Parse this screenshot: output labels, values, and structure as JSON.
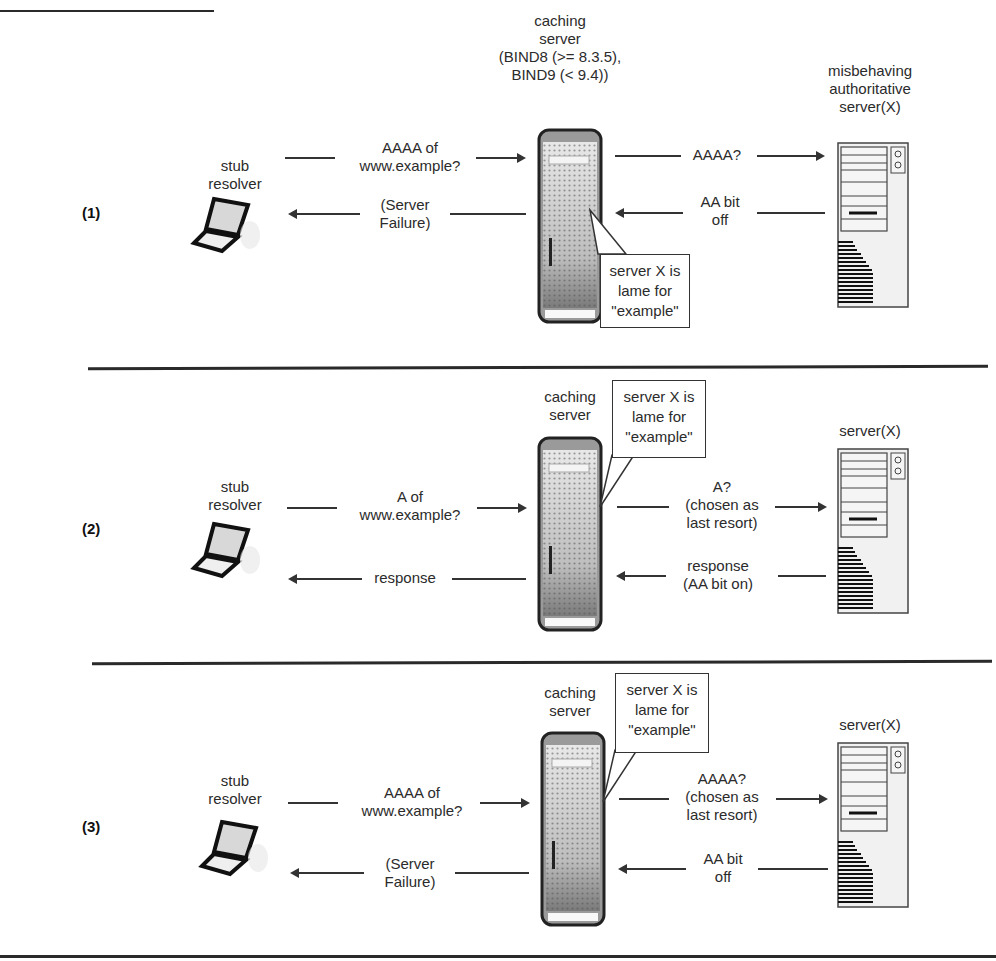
{
  "panels": [
    {
      "number": "(1)",
      "client": {
        "label_line1": "stub",
        "label_line2": "resolver"
      },
      "cache": {
        "label_lines": [
          "caching",
          "server",
          "(BIND8 (>= 8.3.5),",
          "BIND9 (< 9.4))"
        ]
      },
      "authoritative": {
        "label_lines": [
          "misbehaving",
          "authoritative",
          "server(X)"
        ]
      },
      "messages": {
        "client_to_cache": [
          "AAAA of",
          "www.example?"
        ],
        "cache_to_client": [
          "(Server",
          "Failure)"
        ],
        "cache_to_auth": [
          "AAAA?"
        ],
        "auth_to_cache": [
          "AA bit",
          "off"
        ]
      },
      "callout": [
        "server X is",
        "lame for",
        "\"example\""
      ]
    },
    {
      "number": "(2)",
      "client": {
        "label_line1": "stub",
        "label_line2": "resolver"
      },
      "cache": {
        "label_lines": [
          "caching",
          "server"
        ]
      },
      "authoritative": {
        "label_lines": [
          "server(X)"
        ]
      },
      "messages": {
        "client_to_cache": [
          "A of",
          "www.example?"
        ],
        "cache_to_client": [
          "response"
        ],
        "cache_to_auth": [
          "A?",
          "(chosen as",
          "last resort)"
        ],
        "auth_to_cache": [
          "response",
          "(AA bit on)"
        ]
      },
      "callout": [
        "server X is",
        "lame for",
        "\"example\""
      ]
    },
    {
      "number": "(3)",
      "client": {
        "label_line1": "stub",
        "label_line2": "resolver"
      },
      "cache": {
        "label_lines": [
          "caching",
          "server"
        ]
      },
      "authoritative": {
        "label_lines": [
          "server(X)"
        ]
      },
      "messages": {
        "client_to_cache": [
          "AAAA of",
          "www.example?"
        ],
        "cache_to_client": [
          "(Server",
          "Failure)"
        ],
        "cache_to_auth": [
          "AAAA?",
          "(chosen as",
          "last resort)"
        ],
        "auth_to_cache": [
          "AA bit",
          "off"
        ]
      },
      "callout": [
        "server X is",
        "lame for",
        "\"example\""
      ]
    }
  ]
}
